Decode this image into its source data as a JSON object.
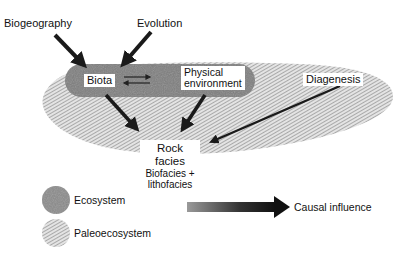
{
  "diagram": {
    "inputs": {
      "biogeography": "Biogeography",
      "evolution": "Evolution"
    },
    "ecosystem_nodes": {
      "biota": "Biota",
      "physical_environment_line1": "Physical",
      "physical_environment_line2": "environment",
      "exchange_symbol": "⇄"
    },
    "diagenesis": "Diagenesis",
    "rock_facies": {
      "title": "Rock facies",
      "line1": "Biofacies +",
      "line2": "lithofacies"
    }
  },
  "legend": {
    "ecosystem": "Ecosystem",
    "paleoecosystem": "Paleoecosystem",
    "causal_influence": "Causal influence"
  },
  "colors": {
    "ecosystem_fill": "#7d7d7d",
    "paleoecosystem_stripe": "#9a9a9a",
    "arrow": "#1a1a1a"
  }
}
